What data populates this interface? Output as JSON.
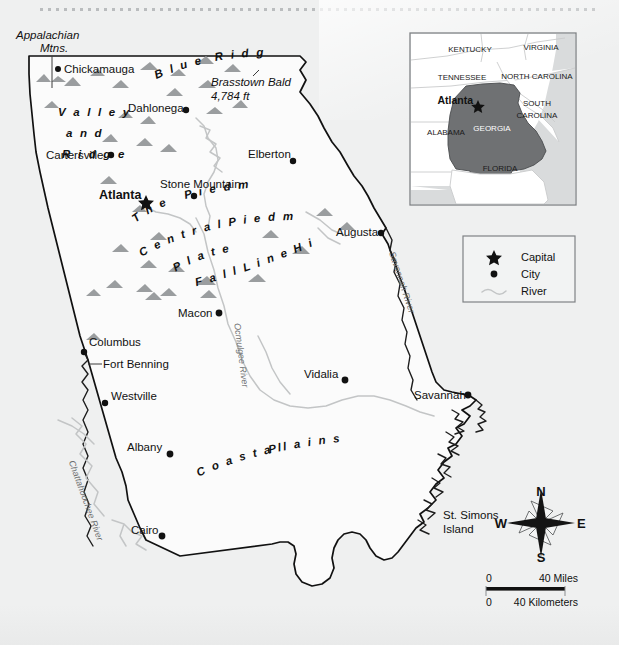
{
  "map": {
    "title": "Georgia Reference Map",
    "background_color": "#eff0f0",
    "annotations": {
      "appalachian": "Appalachian\nMtns.",
      "appalachian_line1": "Appalachian",
      "appalachian_line2": "Mtns.",
      "brasstown_name": "Brasstown Bald",
      "brasstown_elev": "4,784 ft",
      "fort_benning": "Fort Benning",
      "stone_mountain": "Stone Mountain"
    },
    "regions": [
      {
        "name": "valley-and-ridge",
        "lines": [
          "V a l l e y",
          "a n d",
          "R i d g e"
        ]
      },
      {
        "name": "blue-ridge",
        "word1": "B l u e",
        "word2": "R i d g e"
      },
      {
        "name": "the-piedmont",
        "word1": "T h e",
        "word2": "P i e d m o n t"
      },
      {
        "name": "central-piedmont-plateau",
        "word1": "C e n t r a l   P i e d m o n t",
        "word2": "P l a t e a u"
      },
      {
        "name": "fall-line-hills",
        "text": "F a l l   L i n e   H i l l s"
      },
      {
        "name": "coastal-plains",
        "word1": "C o a s t a l",
        "word2": "P l a i n s"
      }
    ],
    "cities": [
      {
        "name": "Chickamauga",
        "type": "city",
        "x": 64,
        "y": 72,
        "dot_x": 58,
        "dot_y": 69,
        "anchor": "start"
      },
      {
        "name": "Dahlonega",
        "type": "city",
        "x": 128,
        "y": 112,
        "dot_x": 186,
        "dot_y": 110,
        "anchor": "start"
      },
      {
        "name": "Cartersville",
        "type": "city",
        "x": 46,
        "y": 159,
        "dot_x": 111,
        "dot_y": 155,
        "anchor": "start"
      },
      {
        "name": "Elberton",
        "type": "city",
        "x": 248,
        "y": 158,
        "dot_x": 293,
        "dot_y": 161,
        "anchor": "start"
      },
      {
        "name": "Atlanta",
        "type": "capital",
        "x": 99,
        "y": 200,
        "dot_x": 146,
        "dot_y": 203,
        "anchor": "start"
      },
      {
        "name": "Augusta",
        "type": "city",
        "x": 336,
        "y": 236,
        "dot_x": 381,
        "dot_y": 233,
        "anchor": "start"
      },
      {
        "name": "Macon",
        "type": "city",
        "x": 178,
        "y": 317,
        "dot_x": 219,
        "dot_y": 313,
        "anchor": "start"
      },
      {
        "name": "Columbus",
        "type": "city",
        "x": 87,
        "y": 346,
        "dot_x": 84,
        "dot_y": 352,
        "anchor": "start"
      },
      {
        "name": "Westville",
        "type": "city",
        "x": 112,
        "y": 400,
        "dot_x": 105,
        "dot_y": 403,
        "anchor": "start"
      },
      {
        "name": "Vidalia",
        "type": "city",
        "x": 304,
        "y": 378,
        "dot_x": 345,
        "dot_y": 380,
        "anchor": "start"
      },
      {
        "name": "Savannah",
        "type": "city",
        "x": 414,
        "y": 398,
        "dot_x": 468,
        "dot_y": 395,
        "anchor": "start"
      },
      {
        "name": "Albany",
        "type": "city",
        "x": 127,
        "y": 451,
        "dot_x": 170,
        "dot_y": 454,
        "anchor": "start"
      },
      {
        "name": "Cairo",
        "type": "city",
        "x": 131,
        "y": 534,
        "dot_x": 162,
        "dot_y": 536,
        "anchor": "start"
      }
    ],
    "island": {
      "line1": "St. Simons",
      "line2": "Island"
    },
    "rivers": [
      {
        "name": "Savannah River",
        "label": "Savannah River"
      },
      {
        "name": "Ocmulgee River",
        "label": "Ocmulgee River"
      },
      {
        "name": "Chattahoochee River",
        "label": "Chattahoochee River"
      }
    ]
  },
  "inset": {
    "states": [
      {
        "name": "kentucky",
        "label": "KENTUCKY",
        "x": 470,
        "y": 52
      },
      {
        "name": "virginia",
        "label": "VIRGINIA",
        "x": 538,
        "y": 50
      },
      {
        "name": "tennessee",
        "label": "TENNESSEE",
        "x": 462,
        "y": 79
      },
      {
        "name": "north-carolina",
        "label": "NORTH CAROLINA",
        "x": 534,
        "y": 78
      },
      {
        "name": "south-carolina-1",
        "label": "SOUTH",
        "x": 530,
        "y": 106
      },
      {
        "name": "south-carolina-2",
        "label": "CAROLINA",
        "x": 531,
        "y": 118
      },
      {
        "name": "alabama",
        "label": "ALABAMA",
        "x": 446,
        "y": 131
      },
      {
        "name": "georgia",
        "label": "GEORGIA",
        "x": 486,
        "y": 128
      },
      {
        "name": "florida",
        "label": "FLORIDA",
        "x": 497,
        "y": 167
      }
    ],
    "capital": "Atlanta",
    "capital_x": 432,
    "capital_y": 101
  },
  "legend": {
    "items": [
      {
        "name": "capital",
        "symbol": "star",
        "label": "Capital"
      },
      {
        "name": "city",
        "symbol": "dot",
        "label": "City"
      },
      {
        "name": "river",
        "symbol": "wave",
        "label": "River"
      }
    ]
  },
  "compass": {
    "north": "N",
    "south": "S",
    "east": "E",
    "west": "W"
  },
  "scale": {
    "miles_zero": "0",
    "miles_max": "40 Miles",
    "km_zero": "0",
    "km_max": "40 Kilometers"
  }
}
